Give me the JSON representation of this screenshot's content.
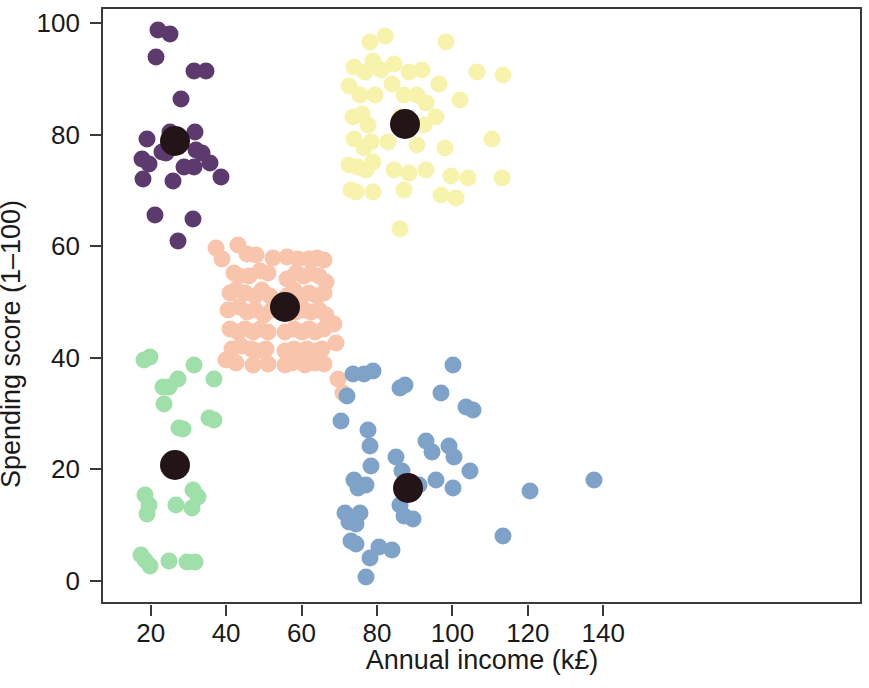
{
  "chart_data": {
    "type": "scatter",
    "title": "",
    "xlabel": "Annual income (k£)",
    "ylabel": "Spending score (1–100)",
    "xlim": [
      8,
      210
    ],
    "ylim": [
      -4,
      105
    ],
    "xticks": [
      20,
      40,
      60,
      80,
      100,
      120,
      140
    ],
    "yticks": [
      0,
      20,
      40,
      60,
      80,
      100
    ],
    "grid": false,
    "legend": "none",
    "marker_size_px": 17,
    "centroid_size_px": 30,
    "centroid_color": "#231418",
    "series": [
      {
        "name": "cluster-purple",
        "color": "#5C3A6E",
        "centroid": [
          26.0,
          79.2
        ],
        "points": [
          [
            21.5,
            99.1
          ],
          [
            24.7,
            98.3
          ],
          [
            20.9,
            94.2
          ],
          [
            30.9,
            91.8
          ],
          [
            34.0,
            91.8
          ],
          [
            27.5,
            86.8
          ],
          [
            24.7,
            80.8
          ],
          [
            31.2,
            80.8
          ],
          [
            18.6,
            79.5
          ],
          [
            22.5,
            77.3
          ],
          [
            23.6,
            77.0
          ],
          [
            31.5,
            77.6
          ],
          [
            33.2,
            77.0
          ],
          [
            17.2,
            75.9
          ],
          [
            19.0,
            75.1
          ],
          [
            28.3,
            74.5
          ],
          [
            31.0,
            74.5
          ],
          [
            35.3,
            75.3
          ],
          [
            17.4,
            72.4
          ],
          [
            25.5,
            72.1
          ],
          [
            38.0,
            72.8
          ],
          [
            20.6,
            66.0
          ],
          [
            30.7,
            65.2
          ],
          [
            26.6,
            61.3
          ]
        ]
      },
      {
        "name": "cluster-green",
        "color": "#9FDFA9",
        "centroid": [
          26.0,
          21.1
        ],
        "points": [
          [
            17.6,
            39.9
          ],
          [
            19.4,
            40.5
          ],
          [
            31.0,
            39.0
          ],
          [
            22.6,
            35.2
          ],
          [
            24.4,
            35.2
          ],
          [
            26.7,
            36.5
          ],
          [
            36.2,
            36.5
          ],
          [
            23.1,
            32.0
          ],
          [
            35.0,
            29.5
          ],
          [
            36.3,
            29.3
          ],
          [
            27.0,
            27.8
          ],
          [
            28.0,
            27.6
          ],
          [
            18.0,
            15.7
          ],
          [
            19.0,
            14.0
          ],
          [
            18.6,
            12.4
          ],
          [
            30.8,
            16.7
          ],
          [
            31.9,
            15.5
          ],
          [
            26.2,
            14.0
          ],
          [
            30.5,
            13.5
          ],
          [
            16.9,
            5.0
          ],
          [
            18.0,
            4.2
          ],
          [
            19.2,
            3.0
          ],
          [
            24.3,
            3.9
          ],
          [
            29.0,
            3.8
          ],
          [
            31.2,
            3.8
          ]
        ]
      },
      {
        "name": "cluster-salmon",
        "color": "#F8C4AC",
        "centroid": [
          55.0,
          49.5
        ],
        "points": [
          [
            42.5,
            60.5
          ],
          [
            45.0,
            59.0
          ],
          [
            47.5,
            58.8
          ],
          [
            52.0,
            58.3
          ],
          [
            55.5,
            58.4
          ],
          [
            58.5,
            58.0
          ],
          [
            61.5,
            58.0
          ],
          [
            63.5,
            58.3
          ],
          [
            65.5,
            57.8
          ],
          [
            41.5,
            55.5
          ],
          [
            43.0,
            55.0
          ],
          [
            45.5,
            55.0
          ],
          [
            48.5,
            56.0
          ],
          [
            50.5,
            55.5
          ],
          [
            55.5,
            54.5
          ],
          [
            58.0,
            55.5
          ],
          [
            60.0,
            55.0
          ],
          [
            62.0,
            55.5
          ],
          [
            64.0,
            55.0
          ],
          [
            66.0,
            54.0
          ],
          [
            40.5,
            52.0
          ],
          [
            42.0,
            52.5
          ],
          [
            44.5,
            52.0
          ],
          [
            47.0,
            51.5
          ],
          [
            49.0,
            52.5
          ],
          [
            51.0,
            51.5
          ],
          [
            55.5,
            51.5
          ],
          [
            57.5,
            52.5
          ],
          [
            59.5,
            51.5
          ],
          [
            61.5,
            52.0
          ],
          [
            63.5,
            51.5
          ],
          [
            65.5,
            52.0
          ],
          [
            40.0,
            49.0
          ],
          [
            43.0,
            49.5
          ],
          [
            45.0,
            48.5
          ],
          [
            47.0,
            49.0
          ],
          [
            49.5,
            48.0
          ],
          [
            51.5,
            49.0
          ],
          [
            55.5,
            48.5
          ],
          [
            58.0,
            48.5
          ],
          [
            60.0,
            49.0
          ],
          [
            62.0,
            48.5
          ],
          [
            64.0,
            49.0
          ],
          [
            66.0,
            48.0
          ],
          [
            40.5,
            45.5
          ],
          [
            42.5,
            45.0
          ],
          [
            44.5,
            45.5
          ],
          [
            46.5,
            45.0
          ],
          [
            48.5,
            45.5
          ],
          [
            50.5,
            45.0
          ],
          [
            55.0,
            45.0
          ],
          [
            57.5,
            45.5
          ],
          [
            59.5,
            45.0
          ],
          [
            61.5,
            45.5
          ],
          [
            63.0,
            45.0
          ],
          [
            65.5,
            45.5
          ],
          [
            41.0,
            42.0
          ],
          [
            43.5,
            42.5
          ],
          [
            46.0,
            42.0
          ],
          [
            48.0,
            41.5
          ],
          [
            50.0,
            42.0
          ],
          [
            55.0,
            41.5
          ],
          [
            57.5,
            42.0
          ],
          [
            59.0,
            41.5
          ],
          [
            61.0,
            42.0
          ],
          [
            63.0,
            41.5
          ],
          [
            65.0,
            42.0
          ],
          [
            39.5,
            40.0
          ],
          [
            42.0,
            39.5
          ],
          [
            46.5,
            39.0
          ],
          [
            50.5,
            39.2
          ],
          [
            55.0,
            39.0
          ],
          [
            57.0,
            39.5
          ],
          [
            60.5,
            39.0
          ],
          [
            63.0,
            39.5
          ],
          [
            65.5,
            39.2
          ],
          [
            68.0,
            46.5
          ],
          [
            68.5,
            43.0
          ],
          [
            69.0,
            36.5
          ],
          [
            70.5,
            34.0
          ],
          [
            36.8,
            60.0
          ],
          [
            38.5,
            58.0
          ]
        ]
      },
      {
        "name": "cluster-yellow",
        "color": "#F8F3AC",
        "centroid": [
          87.0,
          82.2
        ],
        "points": [
          [
            77.5,
            97.0
          ],
          [
            81.5,
            98.0
          ],
          [
            97.8,
            97.0
          ],
          [
            73.5,
            92.5
          ],
          [
            76.3,
            91.5
          ],
          [
            78.5,
            93.5
          ],
          [
            80.5,
            92.0
          ],
          [
            84.0,
            93.0
          ],
          [
            88.0,
            91.5
          ],
          [
            91.5,
            92.0
          ],
          [
            96.0,
            89.5
          ],
          [
            106.0,
            91.5
          ],
          [
            113.0,
            91.0
          ],
          [
            72.0,
            89.0
          ],
          [
            75.0,
            87.5
          ],
          [
            79.0,
            87.5
          ],
          [
            83.5,
            89.5
          ],
          [
            86.5,
            87.5
          ],
          [
            90.0,
            87.5
          ],
          [
            92.5,
            86.0
          ],
          [
            101.5,
            86.5
          ],
          [
            73.0,
            83.5
          ],
          [
            75.5,
            84.0
          ],
          [
            77.0,
            82.0
          ],
          [
            85.5,
            83.5
          ],
          [
            92.0,
            82.0
          ],
          [
            95.0,
            83.5
          ],
          [
            73.5,
            79.5
          ],
          [
            76.0,
            78.0
          ],
          [
            78.0,
            79.0
          ],
          [
            82.5,
            79.0
          ],
          [
            90.0,
            78.5
          ],
          [
            97.5,
            78.0
          ],
          [
            110.0,
            79.5
          ],
          [
            72.0,
            75.0
          ],
          [
            74.5,
            74.5
          ],
          [
            76.5,
            74.0
          ],
          [
            78.5,
            75.5
          ],
          [
            84.0,
            74.0
          ],
          [
            88.0,
            73.5
          ],
          [
            92.5,
            74.0
          ],
          [
            99.0,
            73.0
          ],
          [
            103.5,
            72.5
          ],
          [
            112.5,
            72.5
          ],
          [
            72.5,
            70.5
          ],
          [
            74.0,
            70.0
          ],
          [
            78.5,
            70.0
          ],
          [
            86.5,
            70.5
          ],
          [
            96.5,
            69.5
          ],
          [
            100.5,
            69.0
          ],
          [
            85.5,
            63.5
          ]
        ]
      },
      {
        "name": "cluster-blue",
        "color": "#7FA3C8",
        "centroid": [
          87.6,
          17.0
        ],
        "points": [
          [
            99.5,
            39.0
          ],
          [
            96.5,
            34.0
          ],
          [
            73.0,
            37.5
          ],
          [
            76.0,
            37.5
          ],
          [
            78.5,
            38.0
          ],
          [
            71.5,
            33.5
          ],
          [
            85.5,
            35.0
          ],
          [
            87.0,
            35.5
          ],
          [
            103.0,
            31.5
          ],
          [
            105.0,
            31.0
          ],
          [
            70.0,
            29.0
          ],
          [
            77.0,
            27.5
          ],
          [
            77.5,
            24.5
          ],
          [
            78.0,
            21.0
          ],
          [
            92.5,
            25.5
          ],
          [
            94.0,
            23.5
          ],
          [
            98.5,
            24.5
          ],
          [
            100.0,
            22.5
          ],
          [
            84.5,
            22.5
          ],
          [
            86.0,
            20.0
          ],
          [
            104.0,
            20.0
          ],
          [
            73.5,
            18.5
          ],
          [
            74.5,
            17.0
          ],
          [
            76.5,
            17.5
          ],
          [
            90.5,
            17.5
          ],
          [
            95.0,
            18.5
          ],
          [
            99.5,
            17.0
          ],
          [
            120.0,
            16.5
          ],
          [
            137.0,
            18.5
          ],
          [
            85.5,
            14.0
          ],
          [
            86.5,
            12.0
          ],
          [
            71.0,
            12.5
          ],
          [
            72.0,
            11.0
          ],
          [
            74.0,
            10.5
          ],
          [
            75.0,
            12.5
          ],
          [
            89.0,
            11.5
          ],
          [
            113.0,
            8.5
          ],
          [
            72.5,
            7.5
          ],
          [
            74.0,
            7.0
          ],
          [
            80.0,
            6.5
          ],
          [
            83.5,
            6.0
          ],
          [
            77.5,
            4.5
          ],
          [
            76.5,
            1.0
          ]
        ]
      }
    ]
  },
  "axes": {
    "x_tick_labels": [
      "20",
      "40",
      "60",
      "80",
      "100",
      "120",
      "140"
    ],
    "y_tick_labels": [
      "0",
      "20",
      "40",
      "60",
      "80",
      "100"
    ],
    "x_axis_title": "Annual income (k£)",
    "y_axis_title": "Spending score (1–100)"
  },
  "colors": {
    "purple": "#5C3A6E",
    "green": "#9FDFA9",
    "salmon": "#F8C4AC",
    "yellow": "#F8F3AC",
    "blue": "#7FA3C8",
    "centroid": "#231418",
    "frame": "#3a3a3a",
    "background": "#ffffff"
  }
}
